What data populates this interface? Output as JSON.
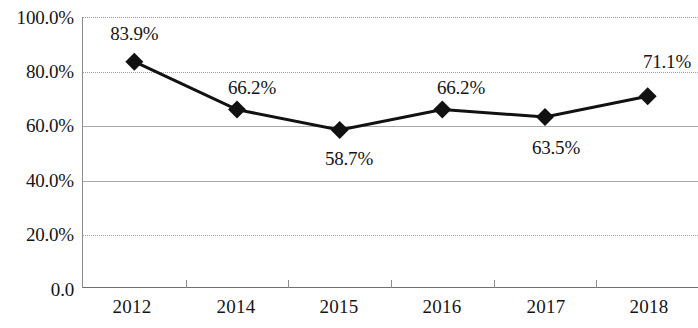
{
  "chart_data": {
    "type": "line",
    "title": "",
    "subtitle": "",
    "xlabel": "",
    "ylabel": "",
    "categories": [
      "2012",
      "2014",
      "2015",
      "2016",
      "2017",
      "2018"
    ],
    "values": [
      83.9,
      66.2,
      58.7,
      66.2,
      63.5,
      71.1
    ],
    "point_labels": [
      "83.9%",
      "66.2%",
      "58.7%",
      "66.2%",
      "63.5%",
      "71.1%"
    ],
    "point_label_position": [
      "above",
      "above",
      "below",
      "above",
      "below",
      "above"
    ],
    "series": [
      {
        "name": "",
        "values": [
          83.9,
          66.2,
          58.7,
          66.2,
          63.5,
          71.1
        ],
        "marker": "diamond",
        "color": "#111111"
      }
    ],
    "ylim": [
      0,
      100
    ],
    "ytick_values": [
      0,
      20,
      40,
      60,
      80,
      100
    ],
    "ytick_labels": [
      "0.0",
      "20.0%",
      "40.0%",
      "60.0%",
      "80.0%",
      "100.0%"
    ],
    "gridlines": {
      "horizontal": true,
      "vertical": false,
      "styles": [
        "solid",
        "dotted",
        "solid",
        "solid",
        "dotted",
        "dotted"
      ]
    },
    "legend": {
      "visible": false,
      "position": "none",
      "entries": []
    },
    "colors": {
      "line": "#111111",
      "marker": "#111111",
      "gridline": "#a9a9a9",
      "axis": "#8d8d8d",
      "text": "#151515",
      "background": "#ffffff"
    }
  }
}
